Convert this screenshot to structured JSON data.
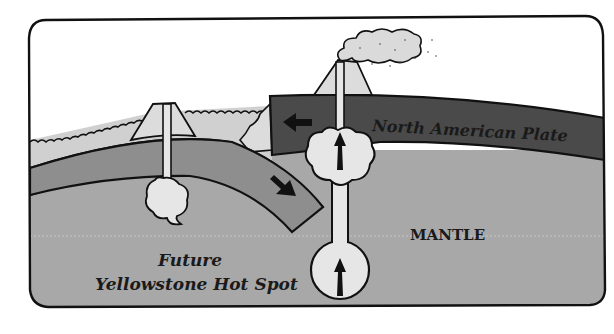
{
  "diagram": {
    "labels": {
      "plate": "North American Plate",
      "mantle": "MANTLE",
      "hotspot_line1": "Future",
      "hotspot_line2": "Yellowstone Hot Spot"
    },
    "colors": {
      "sky": "#ffffff",
      "ocean": "#d0d0d0",
      "volcano": "#dcdcdc",
      "oceanic_plate": "#8e8e8e",
      "continental_plate": "#4a4a4a",
      "mantle": "#a8a8a8",
      "magma": "#e6e6e6",
      "outline": "#111111"
    }
  }
}
